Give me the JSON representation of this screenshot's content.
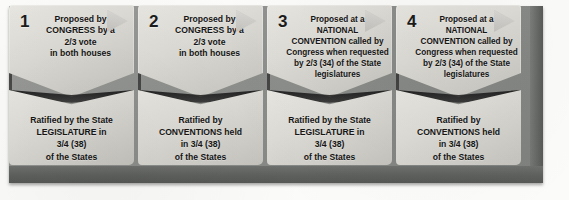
{
  "diagram": {
    "colors": {
      "panel_bg": "#8f918e",
      "card_bg": "#dddbd5",
      "text": "#141414",
      "page_bg": "#fbfbfa"
    },
    "columns": [
      {
        "number": "1",
        "proposal": {
          "lines": [
            "Proposed by",
            "CONGRESS by a",
            "2/3 vote",
            "in both houses"
          ]
        },
        "ratification": {
          "lines": [
            "Ratified by the State",
            "LEGISLATURE in",
            "3/4 (38)",
            "of the States"
          ]
        }
      },
      {
        "number": "2",
        "proposal": {
          "lines": [
            "Proposed by",
            "CONGRESS by a",
            "2/3 vote",
            "in both houses"
          ]
        },
        "ratification": {
          "lines": [
            "Ratified by",
            "CONVENTIONS held",
            "in 3/4 (38)",
            "of the States"
          ]
        }
      },
      {
        "number": "3",
        "proposal": {
          "lines": [
            "Proposed at a",
            "NATIONAL",
            "CONVENTION called by",
            "Congress when requested",
            "by 2/3 (34) of the State",
            "legislatures"
          ]
        },
        "ratification": {
          "lines": [
            "Ratified by the State",
            "LEGISLATURE in",
            "3/4 (38)",
            "of the States"
          ]
        }
      },
      {
        "number": "4",
        "proposal": {
          "lines": [
            "Proposed at a",
            "NATIONAL",
            "CONVENTION called by",
            "Congress when requested",
            "by 2/3 (34) of the State",
            "legislatures"
          ]
        },
        "ratification": {
          "lines": [
            "Ratified by",
            "CONVENTIONS held",
            "in 3/4 (38)",
            "of the States"
          ]
        }
      }
    ]
  }
}
